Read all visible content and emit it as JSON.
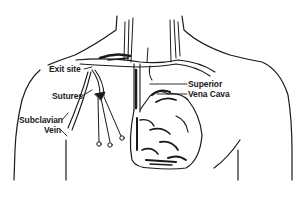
{
  "diagram": {
    "style": "black ink line illustration on white",
    "colors": {
      "background": "#ffffff",
      "ink": "#1a1a1a"
    },
    "labels": {
      "exit_site": "Exit site",
      "sutures": "Sutures",
      "subclavian_line1": "Subclavian",
      "subclavian_line2": "Vein",
      "svc_line1": "Superior",
      "svc_line2": "Vena Cava"
    },
    "structures": [
      "torso-outline",
      "neck",
      "clavicles",
      "subclavian-vein",
      "catheter",
      "sutures",
      "superior-vena-cava",
      "heart"
    ]
  }
}
